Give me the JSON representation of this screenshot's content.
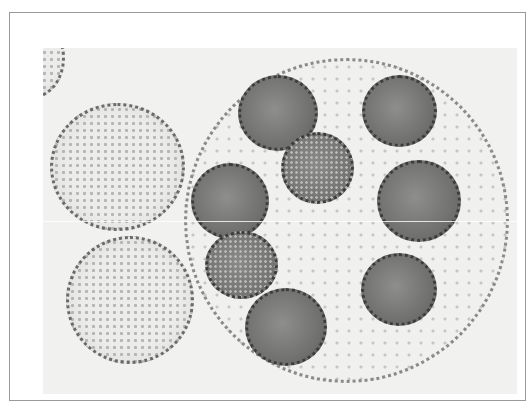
{
  "image": {
    "subject": "Volvox colonies micrograph",
    "description": "Grayscale light micrograph: one large spherical colony containing eight dark daughter colonies, two smaller colonies on the left, and a partial colony at the top-left corner",
    "colors": {
      "background": "#f1f1ef",
      "frame_border": "#9a9a9a",
      "daughter_colony": "#6e6e6c"
    },
    "counts": {
      "large_colonies": 1,
      "daughter_colonies": 8,
      "small_colonies": 2,
      "partial_colonies": 1
    }
  }
}
